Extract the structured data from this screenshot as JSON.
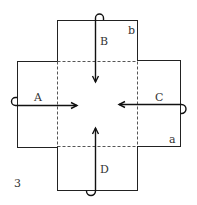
{
  "figure": {
    "number": "3",
    "corner_labels": {
      "top_right": "b",
      "bottom_right": "a"
    },
    "flaps": [
      {
        "id": "A",
        "label": "A",
        "side": "left",
        "direction": "right"
      },
      {
        "id": "B",
        "label": "B",
        "side": "top",
        "direction": "down"
      },
      {
        "id": "C",
        "label": "C",
        "side": "right",
        "direction": "left"
      },
      {
        "id": "D",
        "label": "D",
        "side": "bottom",
        "direction": "up"
      }
    ],
    "colors": {
      "line": "#222222",
      "dash": "#555555",
      "text": "#333333"
    }
  }
}
